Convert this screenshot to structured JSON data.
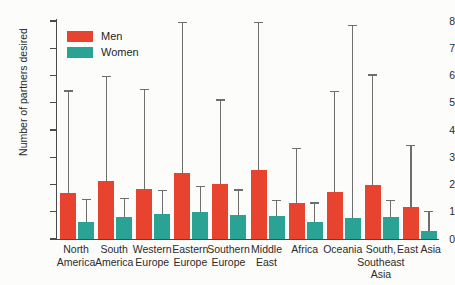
{
  "chart_data": {
    "type": "bar",
    "title": "",
    "xlabel": "",
    "ylabel": "Number of partners desired",
    "ylim": [
      0,
      8
    ],
    "yticks": [
      0,
      1,
      2,
      3,
      4,
      5,
      6,
      7,
      8
    ],
    "grid": false,
    "legend_position": "top-left",
    "error_bars": "upper whisker only",
    "categories": [
      "North\nAmerica",
      "South\nAmerica",
      "Western\nEurope",
      "Eastern\nEurope",
      "Southern\nEurope",
      "Middle\nEast",
      "Africa",
      "Oceania",
      "South,\nSoutheast\nAsia",
      "East Asia"
    ],
    "series": [
      {
        "name": "Men",
        "color": "#e8432e",
        "values": [
          1.69,
          2.12,
          1.84,
          2.43,
          2.03,
          2.54,
          1.33,
          1.74,
          1.97,
          1.19
        ],
        "error_upper": [
          5.41,
          5.94,
          5.47,
          7.93,
          5.08,
          7.93,
          3.29,
          5.39,
          6.0,
          3.41
        ]
      },
      {
        "name": "Women",
        "color": "#2ba394",
        "values": [
          0.64,
          0.79,
          0.92,
          1.0,
          0.89,
          0.86,
          0.61,
          0.78,
          0.82,
          0.3
        ],
        "error_upper": [
          1.43,
          1.46,
          1.75,
          1.9,
          1.78,
          1.4,
          1.3,
          7.8,
          1.4,
          1.0
        ]
      }
    ]
  },
  "legend": {
    "items": [
      {
        "label": "Men",
        "color": "#e8432e"
      },
      {
        "label": "Women",
        "color": "#2ba394"
      }
    ]
  }
}
